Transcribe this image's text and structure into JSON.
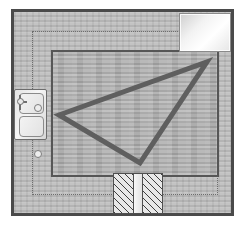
{
  "plan": {
    "title": "Kitchen Work Triangle Floor Plan",
    "canvas_width": 245,
    "canvas_height": 228,
    "background_color": "#ffffff"
  },
  "colors": {
    "outer_wall_stroke": "#4a4a4a",
    "outer_wall_fill": "#b9b9b9",
    "inner_floor_stroke": "#565656",
    "inner_floor_fill": "#ababab",
    "clearance_line": "#6e6e6e",
    "triangle_stroke": "#5f5f5f",
    "fixture_stroke": "#6d6d6d",
    "refrigerator_fill": "#ffffff",
    "range_hatch": "#3f3f3f"
  },
  "structure": {
    "outer_wall": {
      "label": "Exterior Wall",
      "x": 11,
      "y": 9,
      "width": 223,
      "height": 207,
      "stroke_width": 3
    },
    "clearance_line": {
      "label": "Clearance / Counter Edge",
      "x": 32,
      "y": 31,
      "width": 186,
      "height": 164,
      "style": "dotted"
    },
    "inner_floor": {
      "label": "Kitchen Floor Area",
      "x": 51,
      "y": 50,
      "width": 168,
      "height": 127,
      "stroke_width": 2
    }
  },
  "fixtures": [
    {
      "id": "refrigerator",
      "label": "Refrigerator",
      "icon": "refrigerator-icon",
      "x": 179,
      "y": 13,
      "width": 52,
      "height": 39,
      "fill": "#ffffff"
    },
    {
      "id": "sink",
      "label": "Double Basin Sink",
      "icon": "sink-icon",
      "x": 14,
      "y": 89,
      "width": 33,
      "height": 51,
      "basins": 2,
      "has_faucet": true
    },
    {
      "id": "range",
      "label": "Range / Cooktop",
      "icon": "range-icon",
      "x": 113,
      "y": 173,
      "width": 50,
      "height": 41,
      "burner_blocks": 2,
      "pattern": "hatched"
    }
  ],
  "work_triangle": {
    "label": "Kitchen Work Triangle",
    "stroke_color": "#5f5f5f",
    "stroke_width": 5,
    "vertices": [
      {
        "name": "sink-vertex",
        "linked_fixture": "sink",
        "x": 59,
        "y": 115
      },
      {
        "name": "refrigerator-vertex",
        "linked_fixture": "refrigerator",
        "x": 207,
        "y": 62
      },
      {
        "name": "range-vertex",
        "linked_fixture": "range",
        "x": 140,
        "y": 163
      }
    ],
    "points_attr": "59,115 207,62 140,163"
  }
}
